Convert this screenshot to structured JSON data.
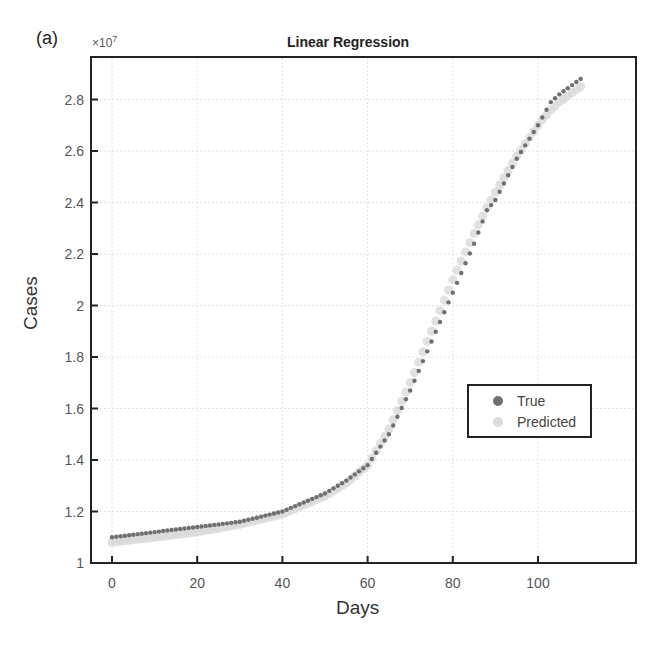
{
  "panel_label": "(a)",
  "exponent_label": "×10",
  "exponent_power": "7",
  "chart_data": {
    "type": "scatter",
    "title": "Linear Regression",
    "xlabel": "Days",
    "ylabel": "Cases",
    "y_multiplier": "×10^7",
    "xlim": [
      -5,
      115
    ],
    "ylim": [
      1.0,
      2.95
    ],
    "xticks": [
      0,
      20,
      40,
      60,
      80,
      100
    ],
    "yticks": [
      1,
      1.2,
      1.4,
      1.6,
      1.8,
      2,
      2.2,
      2.4,
      2.6,
      2.8
    ],
    "ytick_labels": [
      "1",
      "1.2",
      "1.4",
      "1.6",
      "1.8",
      "2",
      "2.2",
      "2.4",
      "2.6",
      "2.8"
    ],
    "grid": true,
    "legend_position": "lower right",
    "series": [
      {
        "name": "True",
        "color": "#707070",
        "x": [
          0,
          10,
          20,
          30,
          40,
          50,
          55,
          60,
          65,
          70,
          75,
          80,
          85,
          88,
          90,
          95,
          100,
          103,
          105,
          110
        ],
        "y": [
          1.1,
          1.12,
          1.14,
          1.16,
          1.2,
          1.27,
          1.32,
          1.38,
          1.5,
          1.67,
          1.86,
          2.05,
          2.24,
          2.37,
          2.41,
          2.57,
          2.7,
          2.79,
          2.82,
          2.88
        ]
      },
      {
        "name": "Predicted",
        "color": "#d9d9d9",
        "x": [
          0,
          10,
          20,
          30,
          40,
          50,
          55,
          60,
          65,
          70,
          75,
          80,
          85,
          88,
          90,
          95,
          100,
          103,
          105,
          110
        ],
        "y": [
          1.08,
          1.1,
          1.12,
          1.15,
          1.19,
          1.26,
          1.31,
          1.38,
          1.52,
          1.7,
          1.9,
          2.1,
          2.28,
          2.38,
          2.44,
          2.58,
          2.7,
          2.76,
          2.79,
          2.85
        ]
      }
    ]
  },
  "legend": {
    "items": [
      {
        "label": "True",
        "color": "#707070"
      },
      {
        "label": "Predicted",
        "color": "#dcdcdc"
      }
    ]
  }
}
